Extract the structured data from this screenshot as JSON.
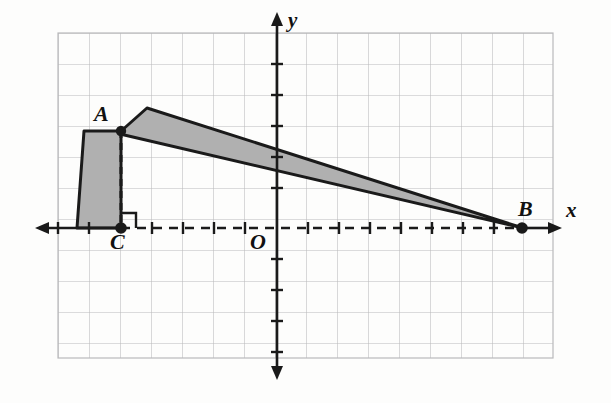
{
  "figure": {
    "background_color": "#fdfdfc",
    "grid": {
      "color": "#b9b9bb",
      "cell_px": 31,
      "left": 58,
      "top": 33,
      "right": 553,
      "bottom": 358,
      "columns": 16,
      "rows": 10.5,
      "visible": true
    },
    "axes": {
      "color": "#1a1a1a",
      "x_axis": {
        "label": "x",
        "y_px": 228,
        "solid_from": 35,
        "solid_to": 120,
        "dashed_from": 120,
        "dashed_to": 522,
        "solid_right_from": 522,
        "solid_right_to": 560,
        "left_arrow": true,
        "right_arrow": true
      },
      "y_axis": {
        "label": "y",
        "x_px": 277,
        "top_px": 14,
        "bottom_px": 378,
        "up_arrow": true,
        "down_arrow": true
      },
      "origin_label": "O",
      "tick_color": "#1a1a1a"
    },
    "points": [
      {
        "name": "A",
        "label": "A",
        "x_px": 121,
        "y_px": 131,
        "marker": "filled-dot",
        "label_pos": "upper-left"
      },
      {
        "name": "B",
        "label": "B",
        "x_px": 522,
        "y_px": 228,
        "marker": "filled-dot",
        "label_pos": "upper-left"
      },
      {
        "name": "C",
        "label": "C",
        "x_px": 121,
        "y_px": 228,
        "marker": "filled-dot",
        "label_pos": "below"
      }
    ],
    "shape": {
      "fill_color": "#b0b0b0",
      "stroke_color": "#1a1a1a",
      "stroke_width": 3,
      "description": "shaded flag-like region: a quadrilateral body left of AC plus a tapering arm from A to B",
      "body_polygon": "84,131 121,131 121,228 77,228",
      "arm_polygon": "121,131 147,108 522,228 121,133"
    },
    "segments": [
      {
        "name": "AC",
        "from": "A",
        "to": "C",
        "style": "dashed",
        "color": "#1a1a1a"
      }
    ],
    "right_angle": {
      "at": "C",
      "size_px": 15,
      "opens": "up-right",
      "color": "#1a1a1a"
    }
  }
}
